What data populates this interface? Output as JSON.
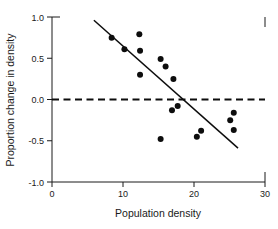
{
  "chart_data": {
    "type": "scatter",
    "title": "",
    "xlabel": "Population density",
    "ylabel": "Proportion change in density",
    "xlim": [
      0,
      30
    ],
    "ylim": [
      -1.0,
      1.0
    ],
    "xticks": [
      0,
      10,
      20,
      30
    ],
    "xticklabels": [
      "0",
      "10",
      "20",
      "30"
    ],
    "yticks": [
      -1.0,
      -0.5,
      0.0,
      0.5,
      1.0
    ],
    "yticklabels": [
      "-1.0",
      "-0.5",
      "0.0",
      "0.5",
      "1.0"
    ],
    "grid": false,
    "legend": null,
    "points": [
      {
        "x": 8.4,
        "y": 0.75
      },
      {
        "x": 10.2,
        "y": 0.61
      },
      {
        "x": 12.3,
        "y": 0.79
      },
      {
        "x": 12.4,
        "y": 0.59
      },
      {
        "x": 12.4,
        "y": 0.3
      },
      {
        "x": 15.3,
        "y": 0.49
      },
      {
        "x": 16.0,
        "y": 0.4
      },
      {
        "x": 17.1,
        "y": 0.25
      },
      {
        "x": 15.3,
        "y": -0.48
      },
      {
        "x": 16.9,
        "y": -0.13
      },
      {
        "x": 17.7,
        "y": -0.08
      },
      {
        "x": 20.4,
        "y": -0.45
      },
      {
        "x": 21.0,
        "y": -0.38
      },
      {
        "x": 25.6,
        "y": -0.16
      },
      {
        "x": 25.1,
        "y": -0.25
      },
      {
        "x": 25.6,
        "y": -0.37
      }
    ],
    "fit_line": {
      "style": "solid",
      "x_start": 5.9,
      "y_start": 0.96,
      "x_end": 26.2,
      "y_end": -0.59
    },
    "reference_line": {
      "style": "dashed",
      "y": 0.0,
      "x_start": 0,
      "x_end": 30
    }
  },
  "axis_geometry": {
    "left_px": 52,
    "right_px": 265,
    "top_px": 17,
    "bottom_px": 182
  }
}
